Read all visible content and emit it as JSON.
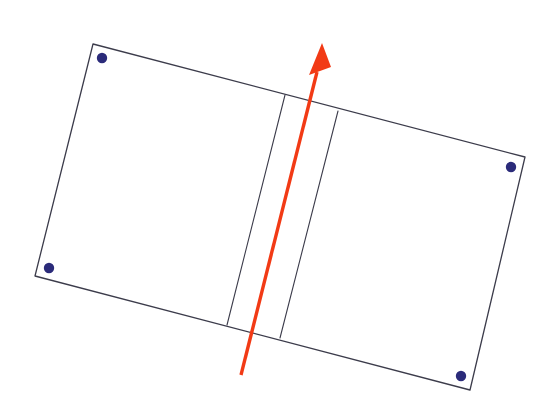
{
  "figure": {
    "background_color": "#ffffff",
    "width": 554,
    "height": 411
  },
  "style": {
    "outline_color": "#3c3c4b",
    "outline_width": 1.3,
    "spine_color": "#3c3c4b",
    "spine_width": 1.1,
    "panel_fill": "#ffffff",
    "dot_color": "#2b2b7a",
    "dot_radius": 5.2,
    "arrow_color": "#f23a15",
    "arrow_shaft_width": 3.4
  },
  "shapes": {
    "left_panel": {
      "name": "left-page",
      "points": "93,44 285,95 227,325 35,276"
    },
    "right_panel": {
      "name": "right-page",
      "points": "338,111 525,157 470,390 280,338"
    },
    "gutter_panel": {
      "name": "book-gutter",
      "points": "285,95 338,111 280,338 227,325"
    },
    "outer_outline": {
      "name": "book-outer-boundary",
      "points": "93,44 525,157 470,390 35,276"
    },
    "spine_left_line": {
      "name": "gutter-left-fold",
      "x1": 285,
      "y1": 95,
      "x2": 227,
      "y2": 325
    },
    "spine_right_line": {
      "name": "gutter-right-fold",
      "x1": 338,
      "y1": 111,
      "x2": 280,
      "y2": 338
    }
  },
  "corner_dots": [
    {
      "label": "top-left-marker",
      "cx": 102,
      "cy": 58
    },
    {
      "label": "bottom-left-marker",
      "cx": 49,
      "cy": 268
    },
    {
      "label": "top-right-marker",
      "cx": 511,
      "cy": 167
    },
    {
      "label": "bottom-right-marker",
      "cx": 461,
      "cy": 376
    }
  ],
  "arrow": {
    "label": "direction-arrow",
    "tail_x": 241,
    "tail_y": 375,
    "tip_x": 322,
    "tip_y": 44,
    "shaft_end_x": 317,
    "shaft_end_y": 72,
    "head_points": "322,43 309,75 331,67"
  }
}
